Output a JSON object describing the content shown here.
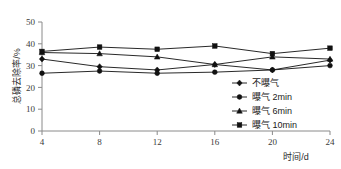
{
  "chart_data": {
    "type": "line",
    "title": "",
    "xlabel": "时间/d",
    "ylabel": "总磷去除率/%",
    "x": [
      4,
      8,
      12,
      16,
      20,
      24
    ],
    "xticklabels": [
      "4",
      "8",
      "12",
      "16",
      "20",
      "24"
    ],
    "yticklabels": [
      "0",
      "10",
      "20",
      "30",
      "40",
      "50"
    ],
    "yticks": [
      0,
      10,
      20,
      30,
      40,
      50
    ],
    "xlim": [
      4,
      24
    ],
    "ylim": [
      0,
      50
    ],
    "grid": false,
    "legend_position": "center-right",
    "series": [
      {
        "name": "不曝气",
        "marker": "diamond",
        "color": "#111111",
        "values": [
          33.0,
          29.5,
          28.0,
          30.5,
          28.0,
          32.5
        ]
      },
      {
        "name": "曝气 2min",
        "marker": "circle",
        "color": "#111111",
        "values": [
          26.5,
          27.5,
          26.5,
          27.0,
          28.0,
          30.0
        ]
      },
      {
        "name": "曝气 6min",
        "marker": "triangle",
        "color": "#111111",
        "values": [
          36.0,
          35.5,
          34.0,
          30.5,
          34.0,
          33.0
        ]
      },
      {
        "name": "曝气 10min",
        "marker": "square",
        "color": "#111111",
        "values": [
          36.5,
          38.5,
          37.5,
          39.0,
          35.5,
          38.0
        ]
      }
    ]
  },
  "axis": {
    "x_label": "时间/d",
    "y_label": "总磷去除率/%"
  },
  "legend": {
    "items": [
      {
        "label": "不曝气"
      },
      {
        "label": "曝气 2min"
      },
      {
        "label": "曝气 6min"
      },
      {
        "label": "曝气 10min"
      }
    ]
  },
  "colors": {
    "axis": "#8a8a8a",
    "data": "#111111",
    "text": "#1a1a1a",
    "background": "#ffffff"
  }
}
